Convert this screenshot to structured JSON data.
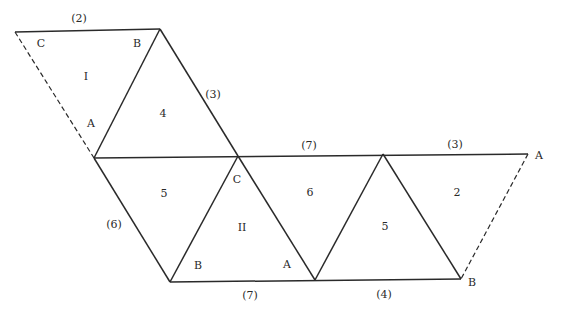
{
  "diagram": {
    "type": "polyhedron-net",
    "edge_color": "#2a2a2a",
    "vertices": {
      "p1": [
        15,
        32
      ],
      "p2": [
        160,
        29
      ],
      "p3": [
        94,
        158
      ],
      "p4": [
        238,
        156
      ],
      "p5": [
        383,
        154
      ],
      "p6": [
        528,
        154
      ],
      "p7": [
        170,
        282
      ],
      "p8": [
        315,
        280
      ],
      "p9": [
        461,
        279
      ]
    },
    "solid_edges": [
      [
        "p1",
        "p2"
      ],
      [
        "p2",
        "p3"
      ],
      [
        "p2",
        "p4"
      ],
      [
        "p3",
        "p6"
      ],
      [
        "p3",
        "p7"
      ],
      [
        "p4",
        "p7"
      ],
      [
        "p4",
        "p8"
      ],
      [
        "p8",
        "p5"
      ],
      [
        "p5",
        "p9"
      ],
      [
        "p7",
        "p9"
      ]
    ],
    "dashed_edges": [
      [
        "p1",
        "p3"
      ],
      [
        "p6",
        "p9"
      ]
    ],
    "labels": {
      "vertex_C_top": "C",
      "vertex_B_top": "B",
      "face_I": "I",
      "vertex_A_left": "A",
      "face_4": "4",
      "edge_2": "(2)",
      "edge_3_left": "(3)",
      "edge_7_top": "(7)",
      "edge_3_right": "(3)",
      "vertex_A_right": "A",
      "face_5_left": "5",
      "vertex_C_center": "C",
      "face_6": "6",
      "face_II": "II",
      "face_5_right": "5",
      "face_2": "2",
      "edge_6": "(6)",
      "vertex_B_bottom": "B",
      "vertex_A_bottom": "A",
      "vertex_B_right": "B",
      "edge_7_bottom": "(7)",
      "edge_4": "(4)"
    }
  }
}
